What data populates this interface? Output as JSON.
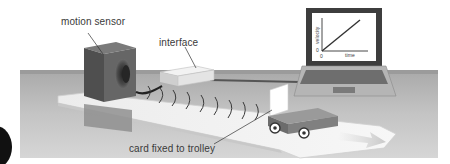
{
  "diagram": {
    "labels": {
      "motion_sensor": "motion sensor",
      "interface": "interface",
      "card": "card fixed to trolley"
    },
    "laptop_graph": {
      "y_axis_label": "velocity",
      "x_axis_label": "time",
      "origin_y": "0",
      "origin_x": "0"
    },
    "colors": {
      "background_panel": "#b9b9b9",
      "track": "#f2f2f2",
      "sensor_box": "#5c5c5c",
      "interface_box": "#e6e6e6",
      "trolley": "#8a8a8a",
      "laptop_body": "#a8a8a8",
      "screen": "#ffffff"
    }
  }
}
